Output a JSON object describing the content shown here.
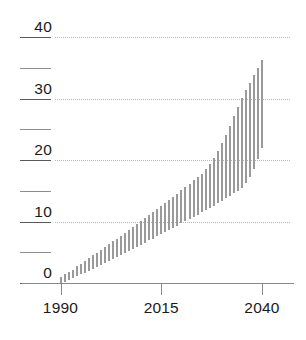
{
  "chart_data": {
    "type": "bar",
    "bar_style": "floating-range",
    "title": "",
    "subtitle": "",
    "xlabel": "",
    "ylabel": "",
    "xlim": [
      1990,
      2040
    ],
    "ylim": [
      0,
      40
    ],
    "grid": "horizontal-dotted",
    "legend": "none",
    "x_tick_labels": [
      "1990",
      "2015",
      "2040"
    ],
    "x_tick_values": [
      1990,
      2015,
      2040
    ],
    "y_tick_values": [
      0,
      5,
      10,
      15,
      20,
      25,
      30,
      35,
      40
    ],
    "y_tick_labels": [
      "0",
      "",
      "10",
      "",
      "20",
      "",
      "30",
      "",
      "40"
    ],
    "y_gridline_values": [
      10,
      20,
      30,
      40
    ],
    "colors": {
      "bar": "#9a9a9a",
      "grid": "#b9b9b9",
      "axis": "#8a8a8a",
      "tick": "#5a5a5a",
      "text": "#1a1a1a",
      "background": "#ffffff"
    },
    "x": [
      1990,
      1991,
      1992,
      1993,
      1994,
      1995,
      1996,
      1997,
      1998,
      1999,
      2000,
      2001,
      2002,
      2003,
      2004,
      2005,
      2006,
      2007,
      2008,
      2009,
      2010,
      2011,
      2012,
      2013,
      2014,
      2015,
      2016,
      2017,
      2018,
      2019,
      2020,
      2021,
      2022,
      2023,
      2024,
      2025,
      2026,
      2027,
      2028,
      2029,
      2030,
      2031,
      2032,
      2033,
      2034,
      2035,
      2036,
      2037,
      2038,
      2039,
      2040
    ],
    "series": [
      {
        "name": "range-low",
        "values": [
          0.0,
          0.2,
          0.5,
          0.8,
          1.1,
          1.4,
          1.7,
          2.0,
          2.3,
          2.6,
          2.9,
          3.2,
          3.6,
          3.9,
          4.2,
          4.5,
          4.9,
          5.2,
          5.5,
          5.9,
          6.2,
          6.5,
          6.9,
          7.2,
          7.6,
          7.9,
          8.3,
          8.6,
          9.0,
          9.3,
          9.7,
          10.0,
          10.4,
          10.8,
          11.1,
          11.5,
          11.9,
          12.2,
          12.6,
          13.0,
          13.4,
          13.8,
          14.2,
          14.6,
          15.0,
          15.5,
          16.3,
          17.3,
          18.6,
          20.2,
          22.0
        ]
      },
      {
        "name": "range-high",
        "values": [
          1.0,
          1.4,
          1.8,
          2.2,
          2.7,
          3.1,
          3.6,
          4.0,
          4.5,
          4.9,
          5.4,
          5.8,
          6.3,
          6.8,
          7.2,
          7.7,
          8.2,
          8.6,
          9.1,
          9.6,
          10.1,
          10.5,
          11.0,
          11.5,
          12.0,
          12.5,
          13.0,
          13.5,
          14.0,
          14.5,
          15.1,
          15.6,
          16.1,
          16.7,
          17.2,
          17.8,
          18.5,
          19.3,
          20.3,
          21.4,
          22.7,
          24.1,
          25.6,
          27.1,
          28.6,
          30.1,
          31.4,
          32.6,
          33.8,
          35.0,
          36.2
        ]
      }
    ]
  }
}
